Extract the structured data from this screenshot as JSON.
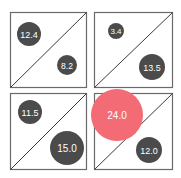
{
  "chart_data": {
    "type": "bubble-grid",
    "title": "",
    "layout": {
      "rows": 2,
      "cols": 2,
      "grid": false,
      "legend": "none"
    },
    "colors": {
      "default_bubble": "#4b4b4b",
      "highlight_bubble": "#f26b75",
      "box_stroke": "#6a6a6a",
      "diagonal": "#3a3a3a"
    },
    "cells": [
      {
        "row": 0,
        "col": 0,
        "upper_left": 12.4,
        "lower_right": 8.2
      },
      {
        "row": 0,
        "col": 1,
        "upper_left": 3.4,
        "lower_right": 13.5
      },
      {
        "row": 1,
        "col": 0,
        "upper_left": 11.5,
        "lower_right": 15.0
      },
      {
        "row": 1,
        "col": 1,
        "upper_left": 24.0,
        "lower_right": 12.0,
        "highlight": "upper_left"
      }
    ],
    "labels": [
      "12.4",
      "8.2",
      "3.4",
      "13.5",
      "11.5",
      "15.0",
      "24.0",
      "12.0"
    ]
  },
  "bubbles": [
    {
      "label": "12.4",
      "cx": 29,
      "cy": 34,
      "r": 12,
      "color": "#4b4b4b",
      "fs": 9
    },
    {
      "label": "8.2",
      "cx": 67,
      "cy": 65,
      "r": 10,
      "color": "#4b4b4b",
      "fs": 8.5
    },
    {
      "label": "3.4",
      "cx": 116,
      "cy": 31,
      "r": 8,
      "color": "#4b4b4b",
      "fs": 8
    },
    {
      "label": "13.5",
      "cx": 152,
      "cy": 67,
      "r": 13,
      "color": "#4b4b4b",
      "fs": 9
    },
    {
      "label": "11.5",
      "cx": 30,
      "cy": 112,
      "r": 12,
      "color": "#4b4b4b",
      "fs": 9
    },
    {
      "label": "15.0",
      "cx": 67,
      "cy": 148,
      "r": 17,
      "color": "#4b4b4b",
      "fs": 10
    },
    {
      "label": "24.0",
      "cx": 117,
      "cy": 115,
      "r": 26,
      "color": "#f26b75",
      "fs": 10
    },
    {
      "label": "12.0",
      "cx": 149,
      "cy": 150,
      "r": 13,
      "color": "#4b4b4b",
      "fs": 9
    }
  ]
}
